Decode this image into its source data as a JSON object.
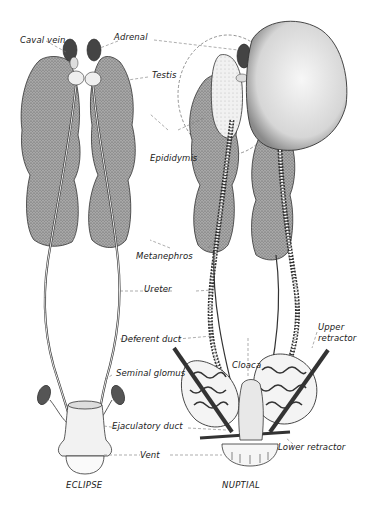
{
  "figure": {
    "type": "anatomical-illustration",
    "panels": [
      {
        "id": "eclipse",
        "caption": "ECLIPSE"
      },
      {
        "id": "nuptial",
        "caption": "NUPTIAL"
      }
    ],
    "labels": {
      "caval_vein": "Caval vein",
      "adrenal": "Adrenal",
      "testis": "Testis",
      "epididymis": "Epididymis",
      "metanephros": "Metanephros",
      "ureter": "Ureter",
      "deferent_duct": "Deferent duct",
      "upper_retractor": "Upper retractor",
      "cloaca": "Cloaca",
      "seminal_glomus": "Seminal glomus",
      "ejaculatory_duct": "Ejaculatory duct",
      "lower_retractor": "Lower retractor",
      "vent": "Vent"
    },
    "colors": {
      "ink": "#1a1a1a",
      "tissue": "#9a9a9a",
      "adrenal": "#4a4a4a",
      "testis_light": "#ececec",
      "background": "#ffffff"
    }
  }
}
